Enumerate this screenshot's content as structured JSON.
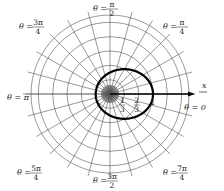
{
  "diagram": {
    "type": "polar-graph",
    "curve": {
      "equation": "r = 1/(2 - cos θ)",
      "color": "#000000"
    },
    "grid": {
      "ring_step": "1/3",
      "rings": 5,
      "spoke_step_radians": "π/12"
    },
    "axis_label": "x",
    "radial_ticks": [
      {
        "num": "1",
        "den": "3"
      },
      {
        "num": "2",
        "den": "3"
      },
      {
        "num": "1",
        "den": ""
      }
    ],
    "angle_labels": [
      {
        "id": "0",
        "prefix": "θ = ",
        "num": "0",
        "den": ""
      },
      {
        "id": "pi4",
        "prefix": "θ = ",
        "num": "π",
        "den": "4"
      },
      {
        "id": "pi2",
        "prefix": "θ = ",
        "num": "π",
        "den": "2"
      },
      {
        "id": "3pi4",
        "prefix": "θ = ",
        "num": "3π",
        "den": "4"
      },
      {
        "id": "pi",
        "prefix": "θ = ",
        "num": "π",
        "den": ""
      },
      {
        "id": "5pi4",
        "prefix": "θ = ",
        "num": "5π",
        "den": "4"
      },
      {
        "id": "3pi2",
        "prefix": "θ = ",
        "num": "3π",
        "den": "2"
      },
      {
        "id": "7pi4",
        "prefix": "θ = ",
        "num": "7π",
        "den": "4"
      }
    ]
  }
}
